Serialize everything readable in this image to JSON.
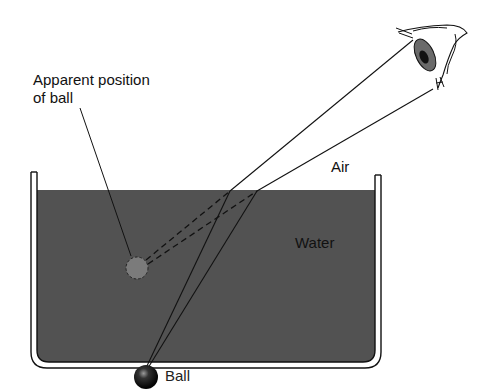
{
  "figure": {
    "labels": {
      "apparent_line1": "Apparent position",
      "apparent_line2": "of ball",
      "air": "Air",
      "water": "Water",
      "ball": "Ball"
    },
    "colors": {
      "water": "#525252",
      "apparent_ball": "#7b7b7b",
      "ball": "#1a1a1a",
      "line": "#111111"
    }
  }
}
